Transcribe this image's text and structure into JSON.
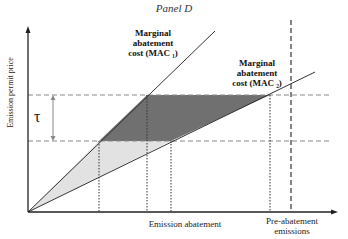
{
  "title": "Panel D",
  "labels": {
    "mac1": [
      "Marginal",
      "abatement",
      "cost (MAC ₁)"
    ],
    "mac2": [
      "Marginal",
      "abatement",
      "cost (MAC ₂)"
    ],
    "tau": "τ",
    "x_axis": "Emission abatement",
    "y_axis": "Emission permit price",
    "pre_abatement": [
      "Pre-abatement",
      "emissions"
    ]
  },
  "colors": {
    "dark_region": "#6e6e6e",
    "light_region": "#e0e0e0",
    "line": "#333333"
  }
}
